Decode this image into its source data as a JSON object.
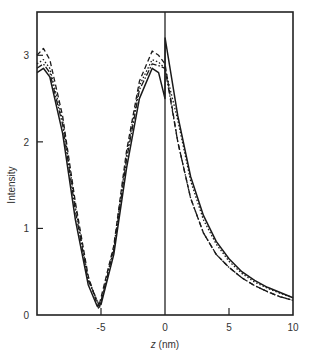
{
  "chart_data": {
    "type": "line",
    "title": "",
    "xlabel": "z (nm)",
    "ylabel": "Intensity",
    "xlim": [
      -10,
      10
    ],
    "ylim": [
      0,
      3.5
    ],
    "xticks": [
      -5,
      0,
      5,
      10
    ],
    "xtick_labels": [
      "-5",
      "0",
      "5",
      "10"
    ],
    "yticks": [
      0,
      1,
      2,
      3
    ],
    "ytick_labels": [
      "0",
      "1",
      "2",
      "3"
    ],
    "grid": false,
    "legend": null,
    "annotations": [
      "vertical line at z = 0 (interface)"
    ],
    "series": [
      {
        "name": "solid",
        "style": "solid",
        "x": [
          -10,
          -9.5,
          -9,
          -8,
          -7,
          -6,
          -5.3,
          -5,
          -4,
          -3,
          -2,
          -1,
          -0.5,
          0,
          0.01,
          1,
          2,
          3,
          4,
          5,
          6,
          7,
          8,
          9,
          10
        ],
        "y": [
          2.8,
          2.85,
          2.75,
          2.1,
          1.1,
          0.35,
          0.1,
          0.12,
          0.7,
          1.7,
          2.5,
          2.85,
          2.8,
          2.5,
          3.2,
          2.3,
          1.6,
          1.15,
          0.85,
          0.65,
          0.5,
          0.4,
          0.32,
          0.26,
          0.2
        ]
      },
      {
        "name": "dashed",
        "style": "dashed",
        "x": [
          -10,
          -9.5,
          -9,
          -8,
          -7,
          -6,
          -5.2,
          -4,
          -3,
          -2,
          -1,
          -0.5,
          0,
          1,
          2,
          3,
          4,
          5,
          6,
          7,
          8,
          9,
          10
        ],
        "y": [
          3.0,
          3.08,
          2.95,
          2.3,
          1.3,
          0.45,
          0.08,
          0.8,
          1.9,
          2.7,
          3.05,
          3.0,
          2.9,
          2.0,
          1.35,
          0.95,
          0.7,
          0.55,
          0.43,
          0.34,
          0.27,
          0.21,
          0.17
        ]
      },
      {
        "name": "dotted",
        "style": "dotted",
        "x": [
          -10,
          -9.5,
          -9,
          -8,
          -7,
          -6,
          -5.1,
          -4,
          -3,
          -2,
          -1,
          -0.5,
          0,
          1,
          2,
          3,
          4,
          5,
          6,
          7,
          8,
          9,
          10
        ],
        "y": [
          2.9,
          2.95,
          2.85,
          2.25,
          1.25,
          0.42,
          0.09,
          0.78,
          1.85,
          2.65,
          2.95,
          2.92,
          2.85,
          2.25,
          1.55,
          1.1,
          0.82,
          0.62,
          0.48,
          0.38,
          0.31,
          0.25,
          0.2
        ]
      },
      {
        "name": "dash-dot",
        "style": "dashdot",
        "x": [
          -10,
          -9.5,
          -9,
          -8,
          -7,
          -6,
          -5.1,
          -4,
          -3,
          -2,
          -1,
          -0.5,
          0,
          1,
          2,
          3,
          4,
          5,
          6,
          7,
          8,
          9,
          10
        ],
        "y": [
          2.85,
          2.9,
          2.8,
          2.2,
          1.2,
          0.4,
          0.1,
          0.75,
          1.8,
          2.6,
          2.9,
          2.88,
          2.85,
          2.0,
          1.35,
          0.95,
          0.7,
          0.55,
          0.43,
          0.34,
          0.27,
          0.21,
          0.17
        ]
      }
    ]
  },
  "axes": {
    "xlabel_italic": "z",
    "xlabel_unit": " (nm)",
    "ylabel": "Intensity"
  }
}
